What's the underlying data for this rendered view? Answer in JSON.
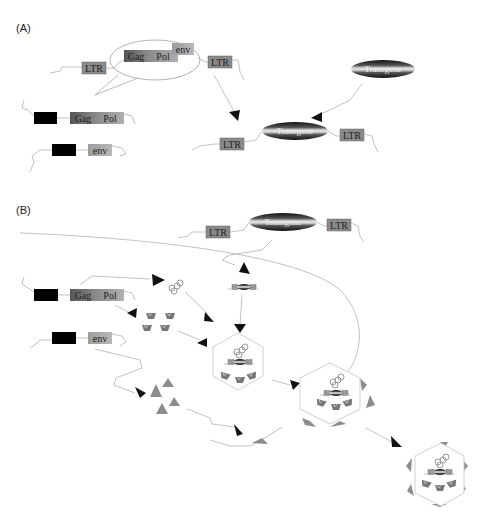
{
  "panels": {
    "a": {
      "label": "(A)"
    },
    "b": {
      "label": "(B)"
    }
  },
  "genes": {
    "ltr": "LTR",
    "gag": "Gag",
    "pol": "Pol",
    "env": "env",
    "transgene": "Transgene"
  },
  "colors": {
    "ltr_box": "#8a8a8a",
    "gag_box": "#6e6e6e",
    "pol_box": "#9a9a9a",
    "env_box": "#a6a6a6",
    "promoter_box": "#000000",
    "arrowhead": "#111111",
    "envelope_triangle": "#8c8c8c",
    "wire": "#bbbbbb",
    "hexagon": "#cccccc"
  }
}
